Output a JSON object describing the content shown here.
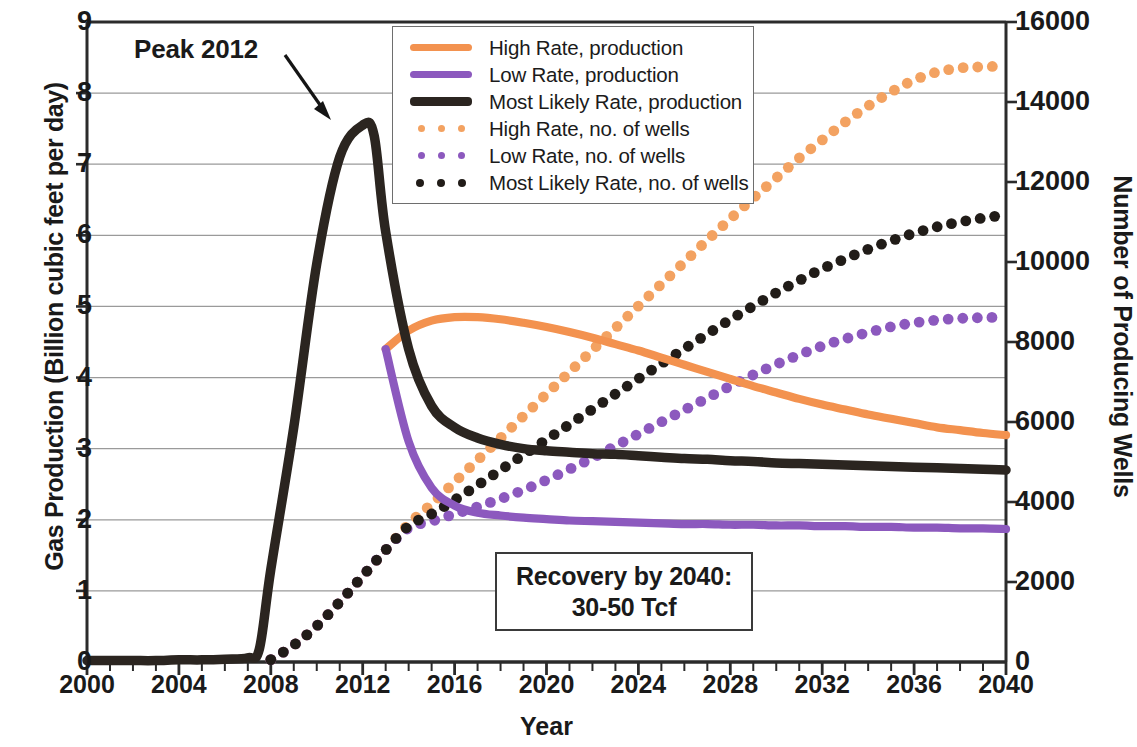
{
  "chart_data": {
    "type": "line",
    "title": "",
    "xlabel": "Year",
    "ylabel": "Gas Production (Billion cubic feet per day)",
    "y2label": "Number of Producing Wells",
    "xlim": [
      2000,
      2040
    ],
    "ylim": [
      0,
      9
    ],
    "y2lim": [
      0,
      16000
    ],
    "xticks": [
      2000,
      2004,
      2008,
      2012,
      2016,
      2020,
      2024,
      2028,
      2032,
      2036,
      2040
    ],
    "xtick_minor_step": 1,
    "yticks": [
      0,
      1,
      2,
      3,
      4,
      5,
      6,
      7,
      8,
      9
    ],
    "y2ticks": [
      0,
      2000,
      4000,
      6000,
      8000,
      10000,
      12000,
      14000,
      16000
    ],
    "grid": "horizontal",
    "legend_position": "top-center",
    "annotations": [
      {
        "name": "peak-label",
        "text": "Peak 2012",
        "x": 2012,
        "y": 7.55
      },
      {
        "name": "recovery-note",
        "line1": "Recovery by 2040:",
        "line2": "30-50 Tcf"
      }
    ],
    "series": [
      {
        "name": "High Rate, production",
        "axis": "left",
        "style": "solid",
        "color": "#F3924F",
        "x": [
          2013,
          2014,
          2015,
          2016,
          2017,
          2018,
          2019,
          2020,
          2021,
          2022,
          2023,
          2024,
          2025,
          2026,
          2027,
          2028,
          2029,
          2030,
          2031,
          2032,
          2033,
          2034,
          2035,
          2036,
          2037,
          2038,
          2039,
          2040
        ],
        "y": [
          4.4,
          4.66,
          4.8,
          4.85,
          4.85,
          4.82,
          4.77,
          4.71,
          4.64,
          4.56,
          4.47,
          4.38,
          4.28,
          4.18,
          4.08,
          3.98,
          3.88,
          3.79,
          3.7,
          3.62,
          3.55,
          3.48,
          3.42,
          3.36,
          3.3,
          3.26,
          3.22,
          3.19
        ]
      },
      {
        "name": "Low Rate, production",
        "axis": "left",
        "style": "solid",
        "color": "#8C59BE",
        "x": [
          2013,
          2014,
          2015,
          2016,
          2017,
          2018,
          2019,
          2020,
          2021,
          2022,
          2023,
          2024,
          2025,
          2026,
          2027,
          2028,
          2029,
          2030,
          2031,
          2032,
          2033,
          2034,
          2035,
          2036,
          2037,
          2038,
          2039,
          2040
        ],
        "y": [
          4.4,
          3.1,
          2.45,
          2.2,
          2.1,
          2.06,
          2.03,
          2.01,
          1.99,
          1.98,
          1.97,
          1.96,
          1.95,
          1.94,
          1.94,
          1.93,
          1.93,
          1.92,
          1.92,
          1.91,
          1.91,
          1.9,
          1.9,
          1.89,
          1.89,
          1.88,
          1.88,
          1.87
        ]
      },
      {
        "name": "Most Likely Rate, production",
        "axis": "left",
        "style": "solid",
        "color": "#2B2520",
        "x": [
          2000,
          2001,
          2002,
          2003,
          2004,
          2005,
          2006,
          2007,
          2007.5,
          2008,
          2009,
          2010,
          2011,
          2012,
          2012.5,
          2013,
          2014,
          2015,
          2016,
          2017,
          2018,
          2019,
          2020,
          2021,
          2022,
          2023,
          2024,
          2025,
          2026,
          2027,
          2028,
          2029,
          2030,
          2031,
          2032,
          2033,
          2034,
          2035,
          2036,
          2037,
          2038,
          2039,
          2040
        ],
        "y": [
          0.02,
          0.02,
          0.02,
          0.02,
          0.03,
          0.03,
          0.04,
          0.06,
          0.18,
          1.3,
          3.3,
          5.6,
          7.1,
          7.55,
          7.4,
          6.05,
          4.4,
          3.6,
          3.3,
          3.15,
          3.06,
          3.0,
          2.97,
          2.95,
          2.93,
          2.92,
          2.9,
          2.88,
          2.86,
          2.85,
          2.83,
          2.82,
          2.8,
          2.79,
          2.78,
          2.77,
          2.76,
          2.75,
          2.74,
          2.73,
          2.72,
          2.71,
          2.7
        ]
      },
      {
        "name": "High Rate, no. of wells",
        "axis": "right",
        "style": "dotted",
        "color": "#F3A261",
        "x": [
          2008,
          2009,
          2010,
          2011,
          2012,
          2013,
          2014,
          2015,
          2016,
          2017,
          2018,
          2019,
          2020,
          2021,
          2022,
          2023,
          2024,
          2025,
          2026,
          2027,
          2028,
          2029,
          2030,
          2031,
          2032,
          2033,
          2034,
          2035,
          2036,
          2037,
          2038,
          2039,
          2040
        ],
        "y": [
          60,
          420,
          900,
          1500,
          2150,
          2800,
          3450,
          3950,
          4500,
          5050,
          5600,
          6150,
          6700,
          7250,
          7800,
          8350,
          8900,
          9450,
          10000,
          10550,
          11080,
          11600,
          12100,
          12600,
          13050,
          13500,
          13900,
          14250,
          14550,
          14750,
          14850,
          14880,
          14900
        ]
      },
      {
        "name": "Low Rate, no. of wells",
        "axis": "right",
        "style": "dotted",
        "color": "#8C59BE",
        "x": [
          2008,
          2009,
          2010,
          2011,
          2012,
          2013,
          2014,
          2015,
          2016,
          2017,
          2018,
          2019,
          2020,
          2021,
          2022,
          2023,
          2024,
          2025,
          2026,
          2027,
          2028,
          2029,
          2030,
          2031,
          2032,
          2033,
          2034,
          2035,
          2036,
          2037,
          2038,
          2039,
          2040
        ],
        "y": [
          60,
          420,
          900,
          1500,
          2150,
          2800,
          3350,
          3520,
          3700,
          3880,
          4080,
          4300,
          4550,
          4820,
          5100,
          5400,
          5700,
          6000,
          6300,
          6600,
          6900,
          7180,
          7440,
          7680,
          7900,
          8080,
          8240,
          8380,
          8480,
          8550,
          8590,
          8610,
          8620
        ]
      },
      {
        "name": "Most Likely Rate, no. of wells",
        "axis": "right",
        "style": "dotted",
        "color": "#211C18",
        "x": [
          2008,
          2009,
          2010,
          2011,
          2012,
          2013,
          2014,
          2015,
          2016,
          2017,
          2018,
          2019,
          2020,
          2021,
          2022,
          2023,
          2024,
          2025,
          2026,
          2027,
          2028,
          2029,
          2030,
          2031,
          2032,
          2033,
          2034,
          2035,
          2036,
          2037,
          2038,
          2039,
          2040
        ],
        "y": [
          60,
          420,
          900,
          1500,
          2150,
          2800,
          3400,
          3700,
          4050,
          4420,
          4800,
          5180,
          5560,
          5940,
          6320,
          6700,
          7080,
          7460,
          7830,
          8200,
          8560,
          8900,
          9230,
          9540,
          9830,
          10080,
          10320,
          10530,
          10720,
          10880,
          11000,
          11100,
          11180
        ]
      }
    ]
  },
  "legend": {
    "items": [
      {
        "label": "High Rate, production",
        "color": "#F3924F",
        "style": "solid"
      },
      {
        "label": "Low Rate, production",
        "color": "#8C59BE",
        "style": "solid"
      },
      {
        "label": "Most Likely Rate, production",
        "color": "#2B2520",
        "style": "solid-thick"
      },
      {
        "label": "High Rate, no. of wells",
        "color": "#F3A261",
        "style": "dotted"
      },
      {
        "label": "Low Rate, no. of wells",
        "color": "#8C59BE",
        "style": "dotted"
      },
      {
        "label": "Most Likely Rate, no. of wells",
        "color": "#211C18",
        "style": "dotted-big"
      }
    ]
  },
  "axes": {
    "x_title": "Year",
    "y_left_title": "Gas Production (Billion cubic feet per day)",
    "y_right_title": "Number of Producing Wells",
    "x_tick_labels": [
      "2000",
      "2004",
      "2008",
      "2012",
      "2016",
      "2020",
      "2024",
      "2028",
      "2032",
      "2036",
      "2040"
    ],
    "y_left_tick_labels": [
      "9",
      "8",
      "7",
      "6",
      "5",
      "4",
      "3",
      "2",
      "1",
      "0"
    ],
    "y_right_tick_labels": [
      "16000",
      "14000",
      "12000",
      "10000",
      "8000",
      "6000",
      "4000",
      "2000",
      "0"
    ]
  },
  "annotations": {
    "peak_label": "Peak 2012",
    "recovery_line1": "Recovery by 2040:",
    "recovery_line2": "30-50 Tcf"
  }
}
